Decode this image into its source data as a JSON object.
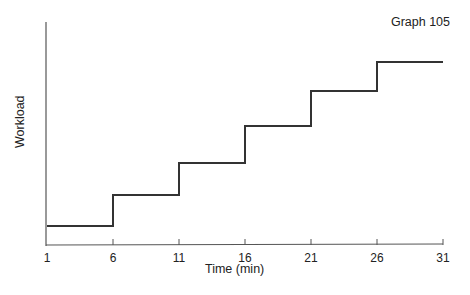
{
  "chart_data": {
    "type": "line",
    "subtype": "step",
    "title": "Graph 105",
    "xlabel": "Time (min)",
    "ylabel": "Workload",
    "x_ticks": [
      1,
      6,
      11,
      16,
      21,
      26,
      31
    ],
    "x_tick_labels": [
      "1",
      "6",
      "11",
      "16",
      "21",
      "26",
      "31"
    ],
    "xlim": [
      1,
      31
    ],
    "y_ticks": [],
    "grid": false,
    "legend": null,
    "series": [
      {
        "name": "Workload",
        "x": [
          1,
          6,
          11,
          16,
          21,
          26,
          31
        ],
        "values": [
          1,
          2,
          3,
          4,
          5,
          6,
          6
        ],
        "relative_heights_px": [
          19,
          50,
          82,
          119,
          154,
          183,
          183
        ],
        "note": "step increases at each 5-minute interval; y-axis unlabeled/unitless"
      }
    ],
    "color": "#333333"
  }
}
